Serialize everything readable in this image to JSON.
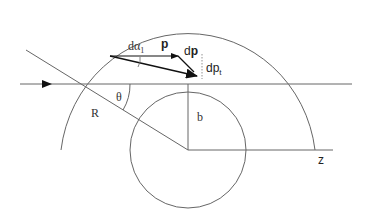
{
  "diagram": {
    "type": "scattering geometry",
    "labels": {
      "d_alpha": "dα",
      "d_alpha_sub": "1",
      "p": "p",
      "dp_d": "d",
      "dp_p": "p",
      "dpt_d": "dp",
      "dpt_sub": "t",
      "theta": "θ",
      "R": "R",
      "b": "b",
      "z": "z"
    },
    "colors": {
      "line": "#555555",
      "arrow": "#111111",
      "background": "#ffffff"
    }
  }
}
